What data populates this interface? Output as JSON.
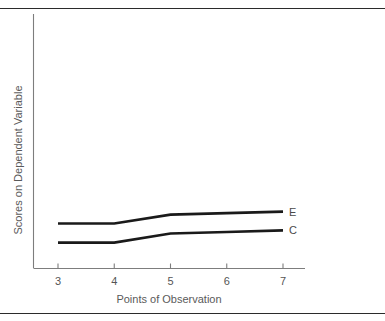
{
  "figure": {
    "rules": {
      "top_label": "top-divider-rule",
      "bottom_label": "bottom-divider-rule"
    }
  },
  "chart_data": {
    "type": "line",
    "title": "",
    "xlabel": "Points of Observation",
    "ylabel": "Scores on Dependent Variable",
    "x": [
      3,
      4,
      5,
      6,
      7
    ],
    "xtick_labels": [
      "3",
      "4",
      "5",
      "6",
      "7"
    ],
    "ytick_labels": [],
    "xlim": [
      3,
      7
    ],
    "ylim": [
      0,
      100
    ],
    "grid": false,
    "legend_position": "line-end-right",
    "series": [
      {
        "name": "E",
        "label": "E",
        "color": "#1a1a1a",
        "values": [
          17.5,
          17.5,
          21.0,
          21.6,
          22.2
        ]
      },
      {
        "name": "C",
        "label": "C",
        "color": "#1a1a1a",
        "values": [
          10.0,
          10.0,
          13.6,
          14.2,
          14.8
        ]
      }
    ]
  }
}
